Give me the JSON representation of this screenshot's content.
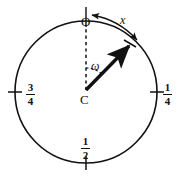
{
  "figure": {
    "type": "geometry-diagram",
    "colors": {
      "stroke": "#111111",
      "background": "#ffffff"
    },
    "circle": {
      "center_x": 86,
      "center_y": 92,
      "radius": 71
    },
    "labels": {
      "center_point": "C",
      "origin_point": "O",
      "angle": "ω",
      "arc": "x"
    },
    "ticks": [
      {
        "name": "quarter",
        "label_num": "1",
        "label_den": "4",
        "position": "right"
      },
      {
        "name": "half",
        "label_num": "1",
        "label_den": "2",
        "position": "bottom"
      },
      {
        "name": "three-quarter",
        "label_num": "3",
        "label_den": "4",
        "position": "left"
      }
    ]
  }
}
